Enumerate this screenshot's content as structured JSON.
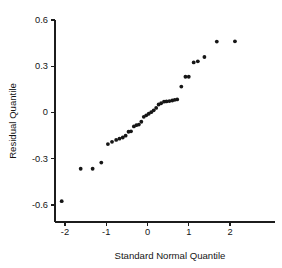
{
  "chart_data": {
    "type": "scatter",
    "title": "",
    "subtitle": "",
    "xlabel": "Standard Normal Quantile",
    "ylabel": "Residual Quantile",
    "xlim": [
      -2.35,
      2.4
    ],
    "ylim": [
      -0.68,
      0.6
    ],
    "xticks": [
      -2,
      -1,
      0,
      1,
      2
    ],
    "xticklabels": [
      "-2",
      "-1",
      "0",
      "1",
      "2"
    ],
    "yticks": [
      -0.6,
      -0.3,
      0,
      0.3,
      0.6
    ],
    "yticklabels": [
      "-0.6",
      "-0.3",
      "0",
      "0.3",
      "0.6"
    ],
    "grid": false,
    "legend": null,
    "marker": "filled-circle",
    "marker_color": "#161616",
    "marker_size_px": 3.0,
    "n_points": 38,
    "series": [
      {
        "name": "residual quantiles",
        "x": [
          -2.08,
          -1.62,
          -1.33,
          -1.12,
          -0.96,
          -0.86,
          -0.76,
          -0.68,
          -0.6,
          -0.53,
          -0.46,
          -0.4,
          -0.33,
          -0.27,
          -0.21,
          -0.15,
          -0.09,
          -0.03,
          0.03,
          0.09,
          0.15,
          0.21,
          0.27,
          0.33,
          0.4,
          0.46,
          0.53,
          0.6,
          0.72,
          0.82,
          0.92,
          1.0,
          1.12,
          1.22,
          1.38,
          1.68,
          2.12,
          0.66
        ],
        "y": [
          -0.575,
          -0.365,
          -0.365,
          -0.325,
          -0.205,
          -0.19,
          -0.178,
          -0.17,
          -0.162,
          -0.15,
          -0.125,
          -0.122,
          -0.09,
          -0.082,
          -0.078,
          -0.06,
          -0.028,
          -0.018,
          -0.008,
          0.002,
          0.014,
          0.03,
          0.052,
          0.06,
          0.07,
          0.072,
          0.074,
          0.078,
          0.085,
          0.168,
          0.232,
          0.232,
          0.325,
          0.332,
          0.36,
          0.46,
          0.462,
          0.082
        ]
      }
    ]
  },
  "axes": {
    "x_title": "Standard Normal Quantile",
    "y_title": "Residual Quantile"
  }
}
